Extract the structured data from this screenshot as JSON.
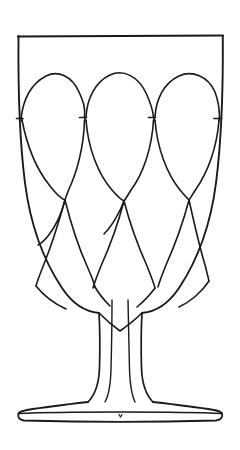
{
  "figure": {
    "style": "black ink line drawing",
    "background_color": "#ffffff",
    "ink_color": "#1a1a1a",
    "canvas": {
      "width": 240,
      "height": 450
    }
  },
  "parts": {
    "rim": {
      "name": "rim",
      "label": "Rim",
      "y": 36,
      "left_x": 18,
      "right_x": 223
    },
    "bowl": {
      "name": "bowl",
      "label": "Bowl",
      "top_y": 36,
      "bottom_y": 300,
      "left_x": 18,
      "right_x": 223,
      "decoration": "pointed-oval lattice"
    },
    "stem": {
      "name": "stem",
      "label": "Stem",
      "top_y": 300,
      "bottom_y": 404,
      "narrow_width": 38,
      "inner_line_count": 2
    },
    "foot": {
      "name": "foot",
      "label": "Foot",
      "top_y": 404,
      "bottom_y": 421,
      "left_x": 18,
      "right_x": 222,
      "has_inner_rim": true
    }
  },
  "decoration": {
    "name": "petal-lattice",
    "label": "Pointed oval lattice",
    "rows": [
      {
        "row_index": 0,
        "label": "Upper petal row",
        "top_y": 72,
        "bottom_y": 175,
        "centers_x": [
          48,
          120,
          192
        ]
      },
      {
        "row_index": 1,
        "label": "Middle petal row",
        "top_y": 108,
        "bottom_y": 210,
        "centers_x": [
          84,
          156
        ]
      },
      {
        "row_index": 2,
        "label": "Lower petal row",
        "top_y": 172,
        "bottom_y": 278,
        "centers_x": [
          48,
          120,
          192
        ]
      }
    ],
    "connector_nodes": [
      {
        "x": 22,
        "y": 118
      },
      {
        "x": 84,
        "y": 118
      },
      {
        "x": 156,
        "y": 118
      },
      {
        "x": 219,
        "y": 118
      }
    ]
  },
  "colors": {
    "ink": "#1a1a1a",
    "paper": "#ffffff"
  }
}
